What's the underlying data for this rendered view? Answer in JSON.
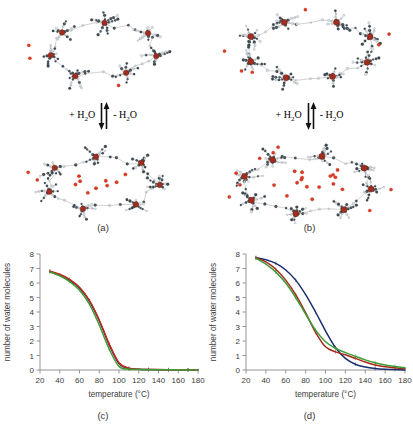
{
  "figure": {
    "panels": [
      {
        "id": "a",
        "caption": "(a)"
      },
      {
        "id": "b",
        "caption": "(b)"
      },
      {
        "id": "c",
        "caption": "(c)"
      },
      {
        "id": "d",
        "caption": "(d)"
      }
    ],
    "reaction": {
      "left_label_prefix": "+ H",
      "left_label_sub": "2",
      "left_label_suffix": "O",
      "right_label_prefix": "- H",
      "right_label_sub": "2",
      "right_label_suffix": "O",
      "arrow_down_icon": "arrow-down-icon",
      "arrow_up_icon": "arrow-up-icon"
    },
    "structure_colors": {
      "metal_center": "#9e2f20",
      "water_oxygen": "#e03a22",
      "dark_atom": "#3c4a52",
      "light_atom": "#d9dde0",
      "bond": "#8d9297"
    }
  },
  "chart_data": [
    {
      "type": "line",
      "panel": "c",
      "title": "(c)",
      "xlabel": "temperature (°C)",
      "ylabel": "number of water molecules",
      "xlim": [
        20,
        180
      ],
      "ylim": [
        0,
        8
      ],
      "xticks": [
        20,
        40,
        60,
        80,
        100,
        120,
        140,
        160,
        180
      ],
      "yticks": [
        0,
        1,
        2,
        3,
        4,
        5,
        6,
        7,
        8
      ],
      "grid": false,
      "legend": "none",
      "x": [
        30,
        40,
        50,
        60,
        70,
        80,
        90,
        100,
        110,
        120,
        130,
        140,
        150,
        160,
        170,
        180
      ],
      "series": [
        {
          "name": "run 1",
          "color": "#1a2e6e",
          "values": [
            6.8,
            6.55,
            6.2,
            5.65,
            4.75,
            3.4,
            1.75,
            0.45,
            0.1,
            0.05,
            0.03,
            0.02,
            0.02,
            0.01,
            0.01,
            0.0
          ]
        },
        {
          "name": "run 2",
          "color": "#c3281c",
          "values": [
            6.82,
            6.6,
            6.25,
            5.7,
            4.8,
            3.45,
            1.8,
            0.5,
            0.12,
            0.06,
            0.04,
            0.03,
            0.02,
            0.02,
            0.01,
            0.01
          ]
        },
        {
          "name": "run 3",
          "color": "#3f9b34",
          "values": [
            6.75,
            6.5,
            6.1,
            5.5,
            4.55,
            3.1,
            1.45,
            0.25,
            0.05,
            0.03,
            0.02,
            0.02,
            0.01,
            0.01,
            0.0,
            0.0
          ]
        }
      ]
    },
    {
      "type": "line",
      "panel": "d",
      "title": "(d)",
      "xlabel": "temperature (°C)",
      "ylabel": "number of water molecules",
      "xlim": [
        20,
        180
      ],
      "ylim": [
        0,
        8
      ],
      "xticks": [
        20,
        40,
        60,
        80,
        100,
        120,
        140,
        160,
        180
      ],
      "yticks": [
        0,
        1,
        2,
        3,
        4,
        5,
        6,
        7,
        8
      ],
      "grid": false,
      "legend": "none",
      "x": [
        30,
        40,
        50,
        60,
        70,
        80,
        90,
        100,
        110,
        120,
        130,
        140,
        150,
        160,
        170,
        180
      ],
      "series": [
        {
          "name": "run 1",
          "color": "#1a2e6e",
          "values": [
            7.75,
            7.6,
            7.35,
            6.9,
            6.2,
            5.2,
            4.0,
            2.7,
            1.55,
            0.8,
            0.4,
            0.2,
            0.1,
            0.05,
            0.03,
            0.0
          ]
        },
        {
          "name": "run 2",
          "color": "#a8281c",
          "values": [
            7.75,
            7.45,
            6.95,
            6.2,
            5.2,
            3.95,
            2.6,
            1.6,
            1.25,
            1.05,
            0.8,
            0.55,
            0.35,
            0.22,
            0.15,
            0.08
          ]
        },
        {
          "name": "run 3",
          "color": "#3f9b34",
          "values": [
            7.7,
            7.3,
            6.75,
            6.0,
            5.0,
            3.85,
            2.75,
            1.95,
            1.5,
            1.2,
            0.95,
            0.7,
            0.5,
            0.35,
            0.25,
            0.15
          ]
        }
      ]
    }
  ]
}
